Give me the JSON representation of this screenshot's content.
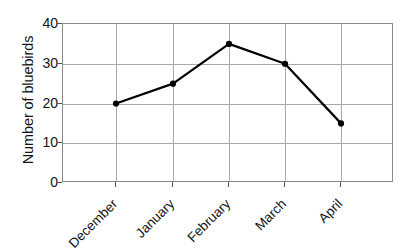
{
  "chart_data": {
    "type": "line",
    "title": "",
    "xlabel": "",
    "ylabel": "Number of bluebirds",
    "categories": [
      "December",
      "January",
      "February",
      "March",
      "April"
    ],
    "values": [
      20,
      25,
      35,
      30,
      15
    ],
    "series": [
      {
        "name": "Number of bluebirds",
        "values": [
          20,
          25,
          35,
          30,
          15
        ]
      }
    ],
    "ylim": [
      0,
      40
    ],
    "y_ticks": [
      0,
      10,
      20,
      30,
      40
    ],
    "y_tick_labels": [
      "0",
      "10",
      "20",
      "30",
      "40"
    ],
    "grid": true,
    "legend": "none",
    "marker": "filled-circle",
    "line_color": "#000000",
    "grid_color": "#a8a8a8",
    "frame_color": "#8a8a8a",
    "background": "#ffffff"
  },
  "axis": {
    "y_title": "Number of bluebirds"
  }
}
